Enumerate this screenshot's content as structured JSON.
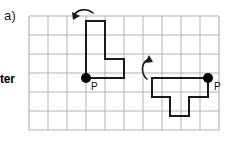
{
  "figure": {
    "part_label": "a)",
    "row_label": "ter",
    "grid": {
      "columns": 10,
      "rows": 6,
      "cell_size": 19,
      "origin_x": 29,
      "origin_y": 16,
      "line_color": "#b3b3b3",
      "border_color": "#b0b0b0"
    },
    "shapes": [
      {
        "name": "left-shape",
        "stroke_color": "#1a1a1a",
        "stroke_width": 2,
        "points": "86,78 86,21 105,21 105,59 124,59 124,78 86,78",
        "vertex": {
          "label": "P",
          "x": 86,
          "y": 78,
          "radius": 5,
          "label_x": 91,
          "label_y": 90,
          "color": "#000000"
        }
      },
      {
        "name": "right-shape",
        "stroke_color": "#1a1a1a",
        "stroke_width": 2,
        "points": "208,78 152,78 152,97 170,97 170,116 189,116 189,97 208,97 208,78",
        "vertex": {
          "label": "P",
          "x": 208,
          "y": 78,
          "radius": 5,
          "label_x": 214,
          "label_y": 90,
          "color": "#000000"
        }
      }
    ],
    "arrows": [
      {
        "name": "rotation-arrow-left",
        "direction": "counterclockwise",
        "path": "M 93 13 C 87 8 78 9 74 15",
        "head": "73,20 72,12 80,16",
        "color": "#1a1a1a"
      },
      {
        "name": "rotation-arrow-right",
        "direction": "counterclockwise",
        "path": "M 147 79 C 141 74 141 64 147 60",
        "head": "149,55 153,62 145,63",
        "color": "#1a1a1a"
      }
    ]
  }
}
